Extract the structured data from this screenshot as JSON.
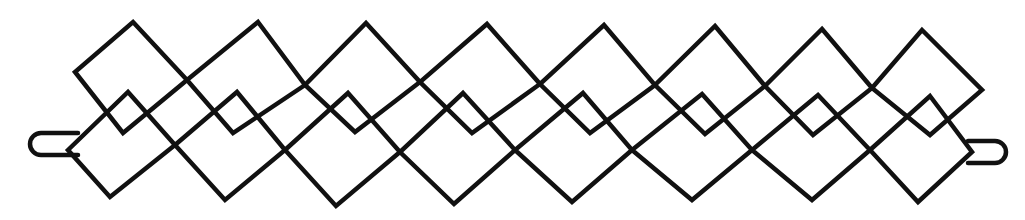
{
  "figure": {
    "title": "",
    "stroke_color": "#111111",
    "background": "#ffffff"
  },
  "upper_squares": [
    {
      "top": [
        133,
        22
      ],
      "left": [
        75,
        72
      ],
      "bottom": [
        123,
        133
      ],
      "right": [
        187,
        80
      ]
    },
    {
      "top": [
        258,
        22
      ],
      "left": [
        187,
        80
      ],
      "bottom": [
        233,
        133
      ],
      "right": [
        305,
        85
      ]
    },
    {
      "top": [
        366,
        23
      ],
      "left": [
        305,
        85
      ],
      "bottom": [
        355,
        132
      ],
      "right": [
        420,
        82
      ]
    },
    {
      "top": [
        487,
        24
      ],
      "left": [
        420,
        82
      ],
      "bottom": [
        472,
        133
      ],
      "right": [
        540,
        84
      ]
    },
    {
      "top": [
        604,
        25
      ],
      "left": [
        540,
        84
      ],
      "bottom": [
        590,
        133
      ],
      "right": [
        655,
        85
      ]
    },
    {
      "top": [
        715,
        26
      ],
      "left": [
        655,
        85
      ],
      "bottom": [
        705,
        134
      ],
      "right": [
        765,
        86
      ]
    },
    {
      "top": [
        822,
        29
      ],
      "left": [
        765,
        86
      ],
      "bottom": [
        813,
        135
      ],
      "right": [
        872,
        88
      ]
    },
    {
      "top": [
        922,
        30
      ],
      "left": [
        872,
        88
      ],
      "bottom": [
        930,
        135
      ],
      "right": [
        982,
        90
      ]
    }
  ],
  "lower_squares": [
    {
      "top": [
        128,
        92
      ],
      "left": [
        68,
        150
      ],
      "bottom": [
        110,
        197
      ],
      "right": [
        175,
        145
      ]
    },
    {
      "top": [
        237,
        92
      ],
      "left": [
        175,
        145
      ],
      "bottom": [
        225,
        200
      ],
      "right": [
        285,
        150
      ]
    },
    {
      "top": [
        348,
        93
      ],
      "left": [
        285,
        150
      ],
      "bottom": [
        336,
        206
      ],
      "right": [
        400,
        152
      ]
    },
    {
      "top": [
        463,
        93
      ],
      "left": [
        400,
        152
      ],
      "bottom": [
        454,
        204
      ],
      "right": [
        515,
        150
      ]
    },
    {
      "top": [
        583,
        93
      ],
      "left": [
        515,
        150
      ],
      "bottom": [
        572,
        202
      ],
      "right": [
        632,
        150
      ]
    },
    {
      "top": [
        702,
        94
      ],
      "left": [
        632,
        150
      ],
      "bottom": [
        692,
        200
      ],
      "right": [
        752,
        150
      ]
    },
    {
      "top": [
        818,
        95
      ],
      "left": [
        752,
        150
      ],
      "bottom": [
        812,
        200
      ],
      "right": [
        870,
        150
      ]
    },
    {
      "top": [
        930,
        96
      ],
      "left": [
        870,
        150
      ],
      "bottom": [
        918,
        202
      ],
      "right": [
        972,
        152
      ]
    }
  ],
  "end_loops": [
    {
      "side": "left",
      "x": [
        30,
        78
      ],
      "y": [
        133,
        155
      ]
    },
    {
      "side": "right",
      "x": [
        968,
        1006
      ],
      "y": [
        141,
        163
      ]
    }
  ]
}
